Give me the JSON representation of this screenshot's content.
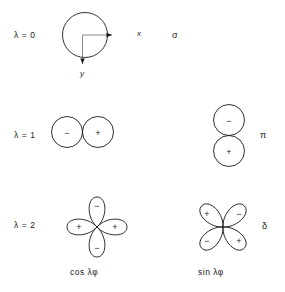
{
  "figure": {
    "background_color": "#ffffff",
    "stroke_color": "#1a1a1a"
  },
  "rows": [
    {
      "lambda_label": "λ = 0",
      "symmetry_label": "σ",
      "axis_x_label": "x",
      "axis_y_label": "y",
      "cos_form": {
        "shape": "single-circle",
        "signs": []
      },
      "sin_form": null
    },
    {
      "lambda_label": "λ = 1",
      "symmetry_label": "π",
      "cos_form": {
        "shape": "two-circles-horizontal",
        "signs": [
          "−",
          "+"
        ]
      },
      "sin_form": {
        "shape": "two-circles-vertical",
        "signs": [
          "−",
          "+"
        ]
      }
    },
    {
      "lambda_label": "λ = 2",
      "symmetry_label": "δ",
      "cos_form": {
        "shape": "four-lobe-axial",
        "signs": [
          "−",
          "+",
          "+",
          "−"
        ]
      },
      "sin_form": {
        "shape": "four-lobe-diagonal",
        "signs": [
          "+",
          "−",
          "−",
          "+"
        ]
      }
    }
  ],
  "captions": {
    "cos": "cos λφ",
    "sin": "sin λφ"
  }
}
